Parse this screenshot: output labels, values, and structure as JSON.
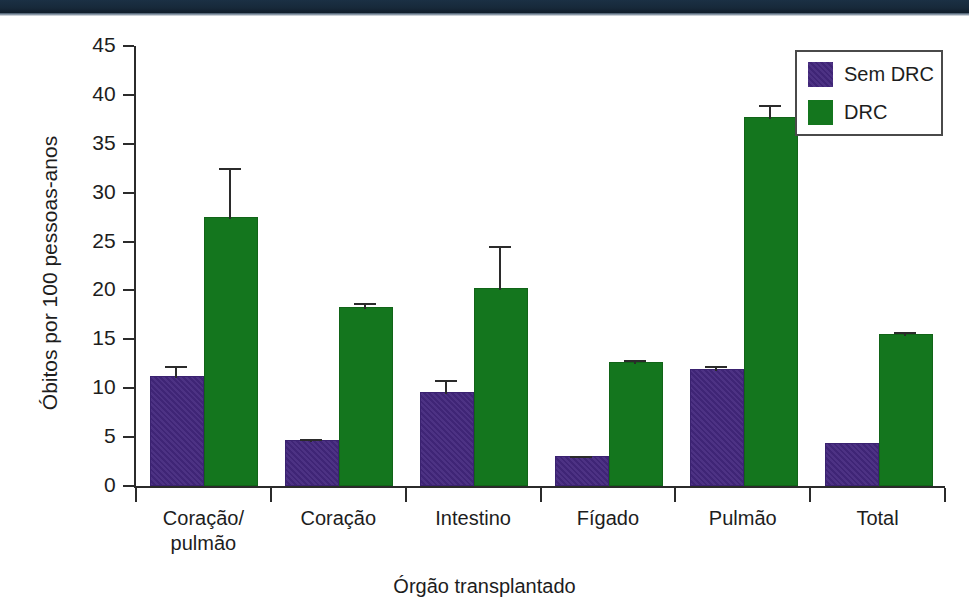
{
  "chart_data": {
    "type": "bar",
    "title": "",
    "subtitle": "",
    "xlabel": "Órgão transplantado",
    "ylabel": "Óbitos por 100 pessoas-anos",
    "ylim": [
      0,
      45
    ],
    "yticks": [
      0,
      5,
      10,
      15,
      20,
      25,
      30,
      35,
      40,
      45
    ],
    "ytick_labels": [
      "0",
      "5",
      "10",
      "15",
      "20",
      "25",
      "30",
      "35",
      "40",
      "45"
    ],
    "grid": false,
    "legend_position": "top-right",
    "categories": [
      "Coração/\npulmão",
      "Coração",
      "Intestino",
      "Fígado",
      "Pulmão",
      "Total"
    ],
    "category_labels_flat": [
      "Coração/ pulmão",
      "Coração",
      "Intestino",
      "Fígado",
      "Pulmão",
      "Total"
    ],
    "series": [
      {
        "name": "Sem DRC",
        "color": "#43277d",
        "values": [
          11.0,
          4.5,
          9.4,
          2.9,
          11.8,
          4.2
        ],
        "errors": [
          1.3,
          0.3,
          1.4,
          0.2,
          0.5,
          0.0
        ]
      },
      {
        "name": "DRC",
        "color": "#14761e",
        "values": [
          27.3,
          18.1,
          20.0,
          12.5,
          37.5,
          15.3
        ],
        "errors": [
          5.2,
          0.6,
          4.5,
          0.4,
          1.5,
          0.5
        ]
      }
    ]
  },
  "legend": {
    "items": [
      {
        "label": "Sem DRC",
        "color": "#43277d"
      },
      {
        "label": "DRC",
        "color": "#14761e"
      }
    ]
  },
  "colors": {
    "sem_drc": "#43277d",
    "drc": "#14761e",
    "axis": "#2b2b2b",
    "text": "#1d1d1d",
    "banner": "#17293a",
    "background": "#ffffff"
  }
}
